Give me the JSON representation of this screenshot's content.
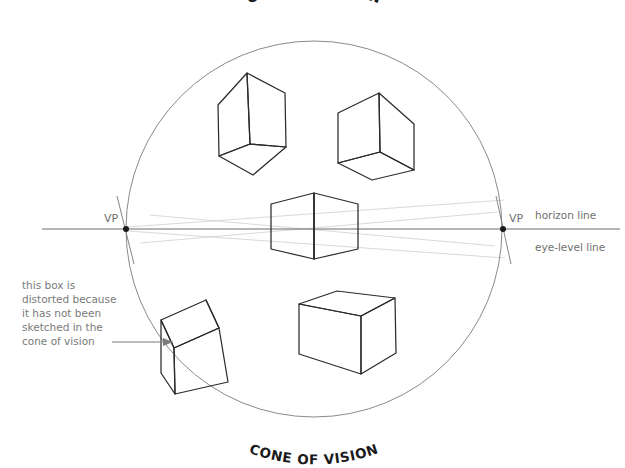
{
  "diagram": {
    "title_top": "CONE OF VISION",
    "title_bottom": "CONE OF VISION",
    "vp_left_label": "VP",
    "vp_right_label": "VP",
    "horizon_label": "horizon line",
    "eye_level_label": "eye-level line",
    "annotation": {
      "line1": "this box is",
      "line2": "distorted because",
      "line3": "it has not been",
      "line4": "sketched in the",
      "line5": "cone of vision"
    },
    "colors": {
      "background": "#ffffff",
      "cube_stroke": "#2b2b2b",
      "circle_stroke": "#8a8a8a",
      "horizon_stroke": "#6a6a6a",
      "label_gray": "#7a7a7a",
      "title_black": "#1a1a1a"
    },
    "geometry": {
      "circle_center_x": 314,
      "circle_center_y": 229,
      "circle_radius": 188,
      "horizon_y": 229,
      "horizon_x_start": 42,
      "horizon_x_end": 620,
      "vp_left_x": 126,
      "vp_right_x": 503
    },
    "cubes": [
      {
        "name": "top-left-cube",
        "position": "upper left, above horizon",
        "view": "from below"
      },
      {
        "name": "top-right-cube",
        "position": "upper right, above horizon",
        "view": "from below"
      },
      {
        "name": "center-cube",
        "position": "centered on horizon line",
        "view": "straight on"
      },
      {
        "name": "distorted-box",
        "position": "lower left, outside cone",
        "view": "from above, distorted"
      },
      {
        "name": "bottom-right-cube",
        "position": "lower right, below horizon",
        "view": "from above"
      }
    ]
  }
}
